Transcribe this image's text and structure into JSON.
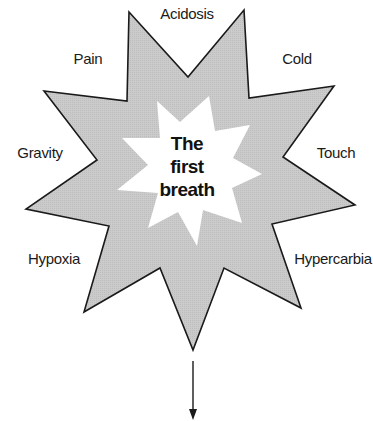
{
  "diagram": {
    "center": {
      "lines": [
        "The",
        "first",
        "breath"
      ]
    },
    "factors": [
      {
        "id": "acidosis",
        "label": "Acidosis"
      },
      {
        "id": "pain",
        "label": "Pain"
      },
      {
        "id": "cold",
        "label": "Cold"
      },
      {
        "id": "gravity",
        "label": "Gravity"
      },
      {
        "id": "touch",
        "label": "Touch"
      },
      {
        "id": "hypoxia",
        "label": "Hypoxia"
      },
      {
        "id": "hypercarbia",
        "label": "Hypercarbia"
      }
    ],
    "colors": {
      "outer_star_fill": "#c8c8c8",
      "outer_star_stroke": "#1a1a1a",
      "inner_star_fill": "#ffffff",
      "text": "#1a1a1a",
      "arrow": "#1a1a1a"
    }
  }
}
